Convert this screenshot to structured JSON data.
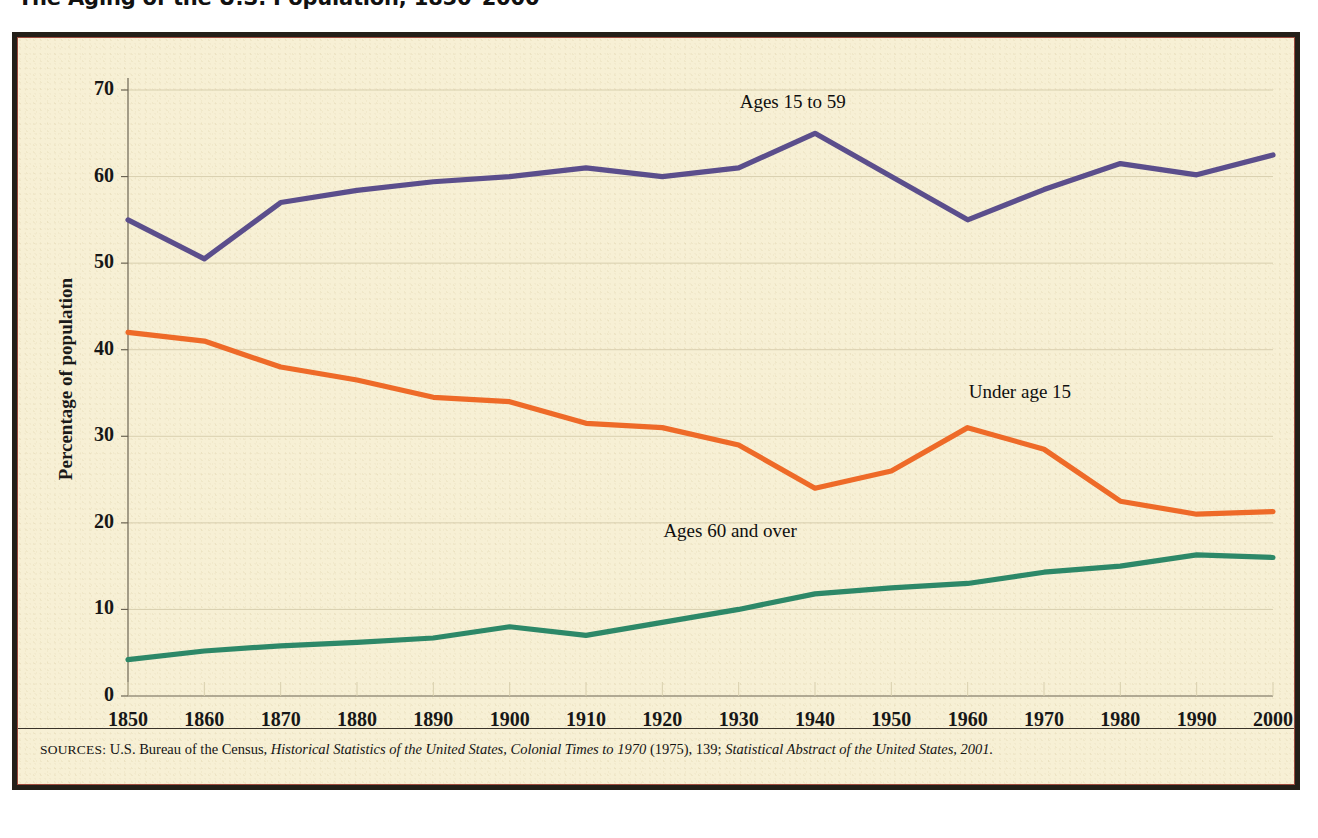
{
  "title": "The Aging of the U.S. Population, 1850–2000",
  "colors": {
    "background": "#F7F0D5",
    "frame": "#231f18",
    "inner_rule": "#9c4a3c",
    "grid": "#d8cfae",
    "axis": "#6b6352",
    "ages_15_to_59": "#5B4E8C",
    "under_age_15": "#EE6A28",
    "ages_60_and_over": "#2D8868"
  },
  "source": {
    "label": "SOURCES:",
    "part1": "U.S. Bureau of the Census,",
    "italic1": "Historical Statistics of the United States, Colonial Times to 1970",
    "part2": "(1975), 139;",
    "italic2": "Statistical Abstract of the United States, 2001."
  },
  "chart_data": {
    "type": "line",
    "title": "The Aging of the U.S. Population, 1850–2000",
    "xlabel": "",
    "ylabel": "Percentage of population",
    "xlim": [
      1850,
      2000
    ],
    "ylim": [
      0,
      70
    ],
    "grid": true,
    "legend_position": "inline-labels",
    "x": [
      1850,
      1860,
      1870,
      1880,
      1890,
      1900,
      1910,
      1920,
      1930,
      1940,
      1950,
      1960,
      1970,
      1980,
      1990,
      2000
    ],
    "xticks": [
      "1850",
      "1860",
      "1870",
      "1880",
      "1890",
      "1900",
      "1910",
      "1920",
      "1930",
      "1940",
      "1950",
      "1960",
      "1970",
      "1980",
      "1990",
      "2000"
    ],
    "yticks": [
      "0",
      "10",
      "20",
      "30",
      "40",
      "50",
      "60",
      "70"
    ],
    "ytick_values": [
      0,
      10,
      20,
      30,
      40,
      50,
      60,
      70
    ],
    "series": [
      {
        "name": "Ages 15 to 59",
        "color": "#5B4E8C",
        "label_x": 1938,
        "label_y": 68.5,
        "values": [
          55.0,
          50.5,
          57.0,
          58.4,
          59.4,
          60.0,
          61.0,
          60.0,
          61.0,
          65.0,
          60.0,
          55.0,
          58.5,
          61.5,
          60.2,
          62.5
        ]
      },
      {
        "name": "Under age 15",
        "color": "#EE6A28",
        "label_x": 1968,
        "label_y": 35.0,
        "values": [
          42.0,
          41.0,
          38.0,
          36.5,
          34.5,
          34.0,
          31.5,
          31.0,
          29.0,
          24.0,
          26.0,
          31.0,
          28.5,
          22.5,
          21.0,
          21.3
        ]
      },
      {
        "name": "Ages 60 and over",
        "color": "#2D8868",
        "label_x": 1928,
        "label_y": 19.0,
        "values": [
          4.2,
          5.2,
          5.8,
          6.2,
          6.7,
          8.0,
          7.0,
          8.5,
          10.0,
          11.8,
          12.5,
          13.0,
          14.3,
          15.0,
          16.3,
          16.0
        ]
      }
    ]
  }
}
